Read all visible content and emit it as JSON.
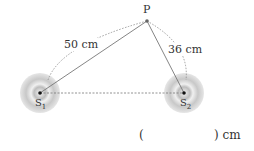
{
  "diagram": {
    "point_p": "P",
    "source_1": "S",
    "source_1_sub": "1",
    "source_2": "S",
    "source_2_sub": "2",
    "distance_s1p": "50 cm",
    "distance_s2p": "36 cm",
    "answer_open": "(",
    "answer_close": ") cm"
  }
}
